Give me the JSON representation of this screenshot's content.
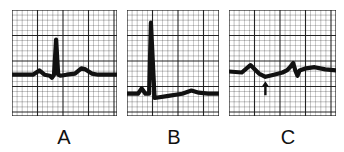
{
  "figure": {
    "panels": [
      {
        "id": "A",
        "label": "A",
        "description": "Normal sinus complex: small P wave, tall narrow QRS, upright T wave on baseline",
        "trace": [
          [
            0,
            0.61
          ],
          [
            0.2,
            0.61
          ],
          [
            0.26,
            0.57
          ],
          [
            0.31,
            0.61
          ],
          [
            0.36,
            0.62
          ],
          [
            0.38,
            0.64
          ],
          [
            0.4,
            0.61
          ],
          [
            0.42,
            0.28
          ],
          [
            0.44,
            0.61
          ],
          [
            0.46,
            0.62
          ],
          [
            0.52,
            0.61
          ],
          [
            0.6,
            0.6
          ],
          [
            0.66,
            0.55
          ],
          [
            0.7,
            0.56
          ],
          [
            0.76,
            0.6
          ],
          [
            0.82,
            0.61
          ],
          [
            1,
            0.61
          ]
        ]
      },
      {
        "id": "B",
        "label": "B",
        "description": "Very tall narrow QRS complex with depressed ST segment and low T wave",
        "trace": [
          [
            0,
            0.79
          ],
          [
            0.12,
            0.79
          ],
          [
            0.16,
            0.74
          ],
          [
            0.2,
            0.79
          ],
          [
            0.24,
            0.79
          ],
          [
            0.26,
            0.12
          ],
          [
            0.3,
            0.83
          ],
          [
            0.45,
            0.81
          ],
          [
            0.6,
            0.79
          ],
          [
            0.7,
            0.76
          ],
          [
            0.78,
            0.78
          ],
          [
            0.88,
            0.79
          ],
          [
            1,
            0.79
          ]
        ]
      },
      {
        "id": "C",
        "label": "C",
        "description": "Low-amplitude irregular complexes with arrow marking a depressed segment",
        "trace": [
          [
            0,
            0.58
          ],
          [
            0.12,
            0.59
          ],
          [
            0.2,
            0.52
          ],
          [
            0.28,
            0.6
          ],
          [
            0.34,
            0.63
          ],
          [
            0.42,
            0.61
          ],
          [
            0.5,
            0.59
          ],
          [
            0.54,
            0.57
          ],
          [
            0.57,
            0.54
          ],
          [
            0.6,
            0.5
          ],
          [
            0.62,
            0.57
          ],
          [
            0.64,
            0.62
          ],
          [
            0.66,
            0.57
          ],
          [
            0.72,
            0.55
          ],
          [
            0.8,
            0.54
          ],
          [
            0.9,
            0.56
          ],
          [
            1,
            0.57
          ]
        ],
        "annotation": {
          "type": "arrow",
          "direction": "up",
          "at": [
            0.34,
            0.72
          ]
        }
      }
    ],
    "grid": {
      "minor_divisions_per_major": 5,
      "line_color": "#1a1a1a",
      "paper_color": "#ffffff",
      "trace_color": "#111111"
    }
  }
}
